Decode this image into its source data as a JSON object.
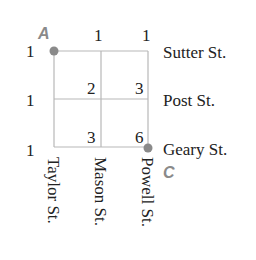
{
  "diagram": {
    "type": "street-grid-path-count",
    "points": {
      "start": "A",
      "end": "C"
    },
    "colors": {
      "grid": "#b8b8b8",
      "point": "#8a8a8a",
      "text": "#222222"
    },
    "streets_horizontal": [
      "Sutter St.",
      "Post St.",
      "Geary St."
    ],
    "streets_vertical": [
      "Taylor St.",
      "Mason St.",
      "Powell St."
    ],
    "path_counts": [
      [
        1,
        1,
        1
      ],
      [
        1,
        2,
        3
      ],
      [
        1,
        3,
        6
      ]
    ],
    "labels": {
      "row0": [
        "1",
        "1",
        "1"
      ],
      "row1": [
        "1",
        "2",
        "3"
      ],
      "row2": [
        "1",
        "3",
        "6"
      ]
    }
  }
}
